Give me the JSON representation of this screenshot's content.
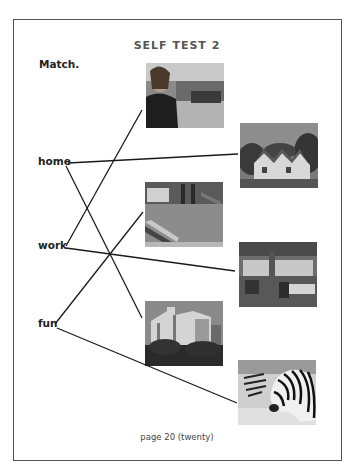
{
  "title": "SELF TEST 2",
  "instruction": "Match.",
  "words": [
    {
      "id": "home",
      "label": "home"
    },
    {
      "id": "work",
      "label": "work"
    },
    {
      "id": "fun",
      "label": "fun"
    }
  ],
  "images": [
    {
      "id": "woman-office",
      "description": "woman standing in office"
    },
    {
      "id": "house",
      "description": "house"
    },
    {
      "id": "playground",
      "description": "playground"
    },
    {
      "id": "office",
      "description": "office room"
    },
    {
      "id": "apartment-building",
      "description": "apartment building"
    },
    {
      "id": "zebra",
      "description": "zebras"
    }
  ],
  "matches": [
    {
      "word": "home",
      "image": "house"
    },
    {
      "word": "home",
      "image": "apartment-building"
    },
    {
      "word": "work",
      "image": "woman-office"
    },
    {
      "word": "work",
      "image": "office"
    },
    {
      "word": "fun",
      "image": "playground"
    },
    {
      "word": "fun",
      "image": "zebra"
    }
  ],
  "footer": "page 20 (twenty)"
}
